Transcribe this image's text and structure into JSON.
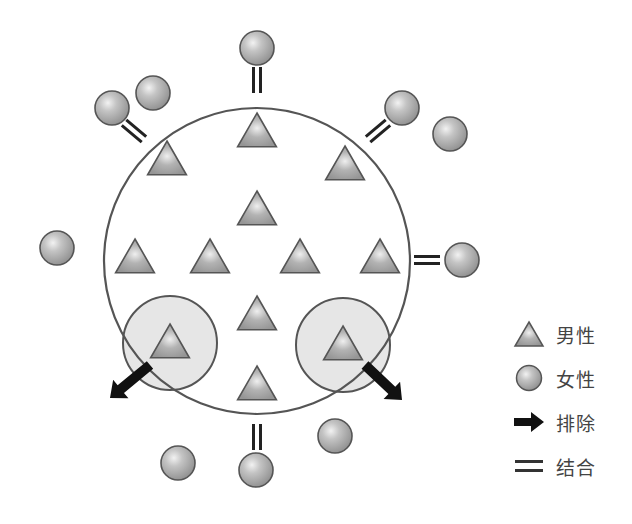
{
  "colors": {
    "outline": "#555555",
    "shape_fill": "#a6a6a6",
    "shape_highlight": "#eeeeee",
    "excluded_zone_fill": "#e6e6e6",
    "arrow": "#111111",
    "bar": "#222222"
  },
  "group_circle": {
    "cx": 257,
    "cy": 261,
    "r": 153
  },
  "men": [
    {
      "x": 257,
      "y": 132
    },
    {
      "x": 167,
      "y": 160
    },
    {
      "x": 345,
      "y": 165
    },
    {
      "x": 257,
      "y": 210
    },
    {
      "x": 135,
      "y": 258
    },
    {
      "x": 210,
      "y": 258
    },
    {
      "x": 300,
      "y": 258
    },
    {
      "x": 380,
      "y": 258
    },
    {
      "x": 257,
      "y": 315
    },
    {
      "x": 170,
      "y": 343
    },
    {
      "x": 343,
      "y": 345
    },
    {
      "x": 257,
      "y": 385
    }
  ],
  "women": [
    {
      "x": 257,
      "y": 48
    },
    {
      "x": 112,
      "y": 108
    },
    {
      "x": 153,
      "y": 93
    },
    {
      "x": 402,
      "y": 108
    },
    {
      "x": 450,
      "y": 134
    },
    {
      "x": 57,
      "y": 248
    },
    {
      "x": 462,
      "y": 260
    },
    {
      "x": 335,
      "y": 436
    },
    {
      "x": 178,
      "y": 463
    },
    {
      "x": 256,
      "y": 470
    }
  ],
  "bonds": [
    {
      "x": 257,
      "y": 80,
      "angle": 90
    },
    {
      "x": 134,
      "y": 131,
      "angle": 40
    },
    {
      "x": 378,
      "y": 131,
      "angle": -40
    },
    {
      "x": 427,
      "y": 260,
      "angle": 0
    },
    {
      "x": 257,
      "y": 437,
      "angle": 90
    }
  ],
  "excluded": [
    {
      "cx": 170,
      "cy": 343,
      "r": 47,
      "arrow": {
        "x1": 150,
        "y1": 365,
        "x2": 110,
        "y2": 398
      }
    },
    {
      "cx": 343,
      "cy": 345,
      "r": 47,
      "arrow": {
        "x1": 365,
        "y1": 365,
        "x2": 402,
        "y2": 400
      }
    }
  ],
  "legend": {
    "items": [
      {
        "icon": "triangle",
        "label": "男性"
      },
      {
        "icon": "circle",
        "label": "女性"
      },
      {
        "icon": "arrow",
        "label": "排除"
      },
      {
        "icon": "double-bar",
        "label": "结合"
      }
    ]
  }
}
